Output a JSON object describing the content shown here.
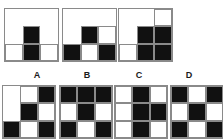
{
  "puzzle": {
    "kind": "matrix-reasoning-visual-analogy",
    "cell_states": {
      "black": "black",
      "white": "white-outlined",
      "empty": "blank"
    },
    "colors": {
      "black_fill": "#111111",
      "white_fill": "#ffffff",
      "border": "#8a8a8a",
      "background": "#ffffff",
      "label_text": "#1a1a1a"
    },
    "prompt_panels": [
      {
        "id": "prompt-1",
        "name": "prompt-panel-1",
        "rows": [
          [
            "empty",
            "empty",
            "empty"
          ],
          [
            "empty",
            "black",
            "empty"
          ],
          [
            "white",
            "black",
            "white"
          ]
        ]
      },
      {
        "id": "prompt-2",
        "name": "prompt-panel-2",
        "rows": [
          [
            "empty",
            "empty",
            "empty"
          ],
          [
            "empty",
            "black",
            "white"
          ],
          [
            "black",
            "white",
            "black"
          ]
        ]
      },
      {
        "id": "prompt-3",
        "name": "prompt-panel-3",
        "rows": [
          [
            "empty",
            "empty",
            "white"
          ],
          [
            "empty",
            "black",
            "black"
          ],
          [
            "white",
            "black",
            "black"
          ]
        ]
      }
    ],
    "options": [
      {
        "id": "option-a",
        "label": "A",
        "rows": [
          [
            "empty",
            "white",
            "black"
          ],
          [
            "empty",
            "black",
            "white"
          ],
          [
            "black",
            "white",
            "black"
          ]
        ]
      },
      {
        "id": "option-b",
        "label": "B",
        "rows": [
          [
            "black",
            "black",
            "black"
          ],
          [
            "white",
            "black",
            "white"
          ],
          [
            "black",
            "white",
            "black"
          ]
        ]
      },
      {
        "id": "option-c",
        "label": "C",
        "rows": [
          [
            "white",
            "black",
            "white"
          ],
          [
            "white",
            "black",
            "black"
          ],
          [
            "white",
            "black",
            "white"
          ]
        ]
      },
      {
        "id": "option-d",
        "label": "D",
        "rows": [
          [
            "black",
            "white",
            "black"
          ],
          [
            "white",
            "black",
            "white"
          ],
          [
            "black",
            "white",
            "black"
          ]
        ]
      }
    ]
  }
}
